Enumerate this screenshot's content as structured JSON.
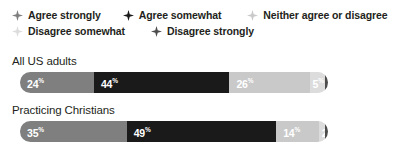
{
  "colors": {
    "agree_strongly": "#7f7f7f",
    "agree_somewhat": "#1a1a1a",
    "neither": "#c9c9c9",
    "disagree_somewhat": "#dcdcdc",
    "disagree_strongly": "#4d4d4d",
    "text": "#231f20",
    "label_light": "#ffffff"
  },
  "legend": {
    "marker_icon": "four-point-star-icon",
    "rows": [
      [
        {
          "label": "Agree strongly",
          "color": "#7f7f7f"
        },
        {
          "label": "Agree somewhat",
          "color": "#1a1a1a"
        },
        {
          "label": "Neither agree or disagree",
          "color": "#c9c9c9"
        }
      ],
      [
        {
          "label": "Disagree somewhat",
          "color": "#dcdcdc"
        },
        {
          "label": "Disagree strongly",
          "color": "#4d4d4d"
        }
      ]
    ]
  },
  "chart_data": {
    "type": "bar",
    "subtype": "stacked-horizontal-100",
    "title": "",
    "xlabel": "",
    "ylabel": "",
    "xlim": [
      0,
      100
    ],
    "grid": false,
    "legend_position": "top",
    "categories": [
      "All US adults",
      "Practicing Christians"
    ],
    "series": [
      {
        "name": "Agree strongly",
        "color": "#7f7f7f",
        "values": [
          24,
          35
        ]
      },
      {
        "name": "Agree somewhat",
        "color": "#1a1a1a",
        "values": [
          44,
          49
        ]
      },
      {
        "name": "Neither agree or disagree",
        "color": "#c9c9c9",
        "values": [
          26,
          14
        ]
      },
      {
        "name": "Disagree somewhat",
        "color": "#dcdcdc",
        "values": [
          5,
          2
        ]
      },
      {
        "name": "Disagree strongly",
        "color": "#4d4d4d",
        "values": [
          1,
          1
        ]
      }
    ],
    "bars": [
      {
        "label": "All US adults",
        "segments": [
          {
            "name": "Agree strongly",
            "value": 24,
            "display": "24",
            "suffix": "%",
            "color": "#7f7f7f",
            "label_color": "#ffffff"
          },
          {
            "name": "Agree somewhat",
            "value": 44,
            "display": "44",
            "suffix": "%",
            "color": "#1a1a1a",
            "label_color": "#ffffff"
          },
          {
            "name": "Neither agree or disagree",
            "value": 26,
            "display": "26",
            "suffix": "%",
            "color": "#c9c9c9",
            "label_color": "#ffffff"
          },
          {
            "name": "Disagree somewhat",
            "value": 5,
            "display": "5",
            "suffix": "%",
            "color": "#dcdcdc",
            "label_color": "#ffffff"
          },
          {
            "name": "Disagree strongly",
            "value": 1,
            "display": "1",
            "suffix": "%",
            "color": "#4d4d4d",
            "label_color": "#ffffff"
          }
        ]
      },
      {
        "label": "Practicing Christians",
        "segments": [
          {
            "name": "Agree strongly",
            "value": 35,
            "display": "35",
            "suffix": "%",
            "color": "#7f7f7f",
            "label_color": "#ffffff"
          },
          {
            "name": "Agree somewhat",
            "value": 49,
            "display": "49",
            "suffix": "%",
            "color": "#1a1a1a",
            "label_color": "#ffffff"
          },
          {
            "name": "Neither agree or disagree",
            "value": 14,
            "display": "14",
            "suffix": "%",
            "color": "#c9c9c9",
            "label_color": "#ffffff"
          },
          {
            "name": "Disagree somewhat",
            "value": 2,
            "display": "2",
            "suffix": "%",
            "color": "#dcdcdc",
            "label_color": "#ffffff"
          },
          {
            "name": "Disagree strongly",
            "value": 1,
            "display": "1",
            "suffix": "%",
            "color": "#4d4d4d",
            "label_color": "#ffffff"
          }
        ]
      }
    ]
  }
}
